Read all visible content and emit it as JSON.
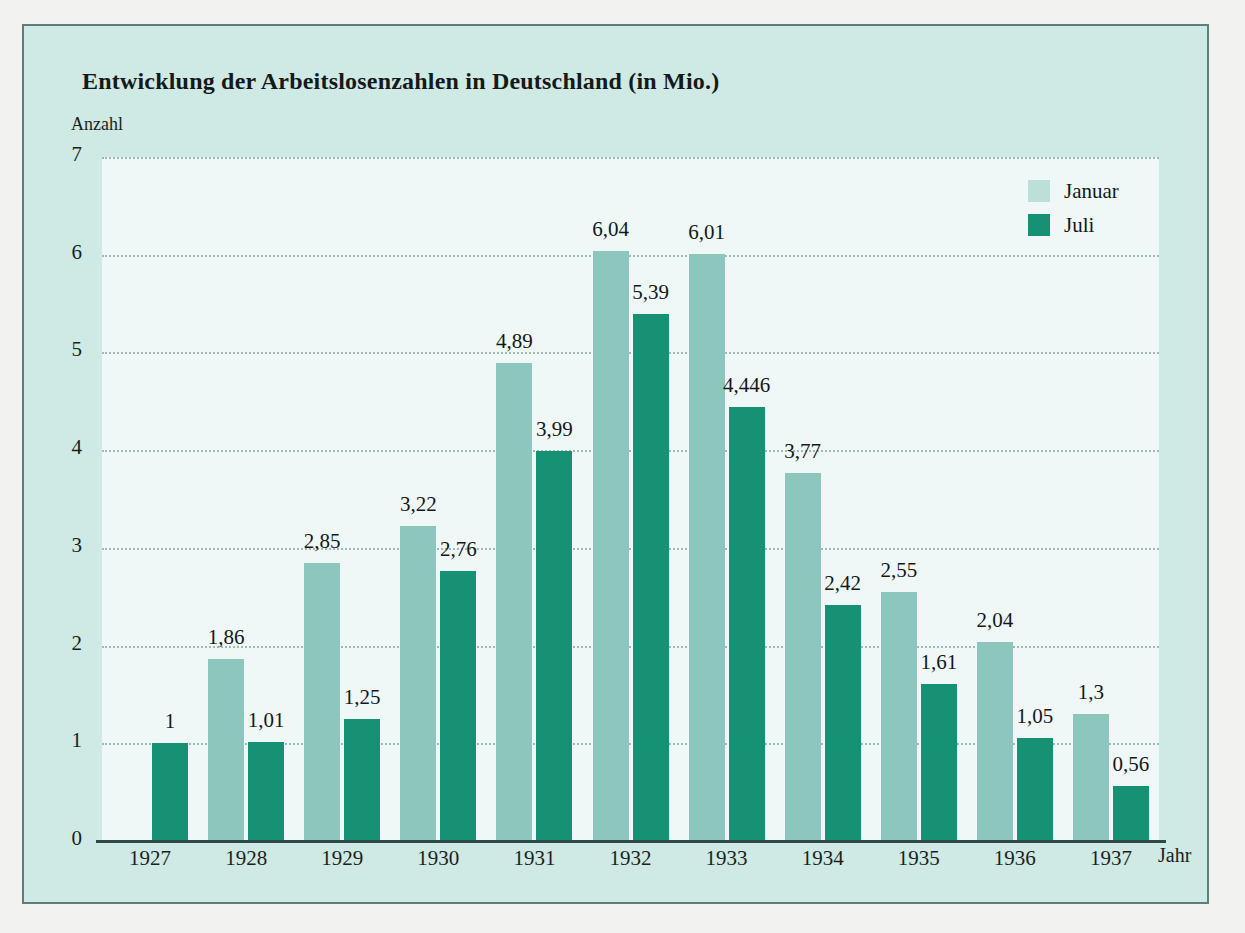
{
  "figure": {
    "title": "Entwicklung der Arbeitslosenzahlen in Deutschland (in Mio.)",
    "y_axis_caption": "Anzahl",
    "x_axis_caption": "Jahr"
  },
  "legend": {
    "position": "top-right",
    "entries": [
      {
        "label": "Januar",
        "color": "#bcdfd9",
        "icon": "legend-swatch-light"
      },
      {
        "label": "Juli",
        "color": "#169174",
        "icon": "legend-swatch-dark"
      }
    ]
  },
  "colors": {
    "page_background": "#f2f2f0",
    "figure_background": "#cfe9e4",
    "figure_border": "#5d7f7c",
    "plot_background": "#eff8f6",
    "gridline": "#9fb9b5",
    "axis_line": "#2e4a48",
    "series_januar": "#8cc6bd",
    "series_juli": "#169174",
    "text": "#14181a"
  },
  "chart_data": {
    "type": "bar",
    "title": "Entwicklung der Arbeitslosenzahlen in Deutschland (in Mio.)",
    "xlabel": "Jahr",
    "ylabel": "Anzahl",
    "ylim": [
      0,
      7
    ],
    "yticks": [
      "0",
      "1",
      "2",
      "3",
      "4",
      "5",
      "6",
      "7"
    ],
    "grid": true,
    "grid_style": "dotted-horizontal",
    "legend_position": "top-right",
    "categories": [
      "1927",
      "1928",
      "1929",
      "1930",
      "1931",
      "1932",
      "1933",
      "1934",
      "1935",
      "1936",
      "1937"
    ],
    "series": [
      {
        "name": "Januar",
        "color": "#8cc6bd",
        "values": [
          null,
          1.86,
          2.85,
          3.22,
          4.89,
          6.04,
          6.01,
          3.77,
          2.55,
          2.04,
          1.3
        ],
        "labels": [
          "",
          "1,86",
          "2,85",
          "3,22",
          "4,89",
          "6,04",
          "6,01",
          "3,77",
          "2,55",
          "2,04",
          "1,3"
        ]
      },
      {
        "name": "Juli",
        "color": "#169174",
        "values": [
          1.0,
          1.01,
          1.25,
          2.76,
          3.99,
          5.39,
          4.446,
          2.42,
          1.61,
          1.05,
          0.56
        ],
        "labels": [
          "1",
          "1,01",
          "1,25",
          "2,76",
          "3,99",
          "5,39",
          "4,446",
          "2,42",
          "1,61",
          "1,05",
          "0,56"
        ]
      }
    ]
  }
}
